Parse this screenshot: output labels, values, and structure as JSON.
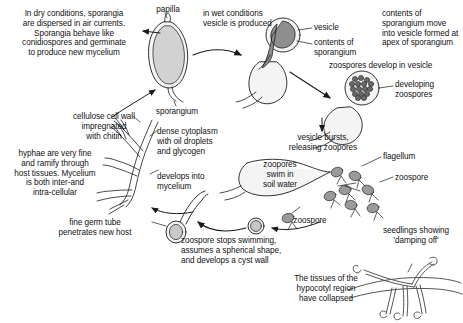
{
  "diagram": {
    "background_color": "#ffffff",
    "ink_color": "#1a1a1a",
    "fill_light": "#f2f2f2",
    "fill_mid": "#d9d9d9",
    "fill_dark": "#8c8c8c"
  },
  "labels": {
    "dry_conditions": "In dry conditions, sporangia\nare dispersed in air currents.\nSporangia behave like\nconidiospores and germinate\nto produce new mycelium",
    "papilla": "papilla",
    "wet_conditions": "in wet conditions\nvesicle is produced",
    "vesicle": "vesicle",
    "contents_of_sporangium": "contents of\nsporangium",
    "contents_move": "contents of\nsporangium move\ninto vesicle formed at\napex of sporangium",
    "sporangium": "sporangium",
    "zoospores_develop": "zoospores develop in vesicle",
    "developing_zoospores": "developing\nzoospores",
    "vesicle_bursts": "vesicle bursts,\nreleasing zoopores",
    "flagellum": "flagellum",
    "zoospore_right": "zoospore",
    "zoopores_swim": "zoopores\nswim in\nsoil water",
    "cellulose_wall": "cellulose cell wall\nimpregnated\nwith chitin",
    "dense_cytoplasm": "dense cytoplasm\nwith oil droplets\nand glycogen",
    "hyphae_fine": "hyphae are very fine\nand ramify through\nhost tissues. Mycelium\nis both inter-and\nintra-cellular",
    "develops_into_mycelium": "develops into\nmycelium",
    "fine_germ_tube": "fine germ tube\npenetrates new host",
    "zoospore_stops": "zoospore stops swimming,\nassumes a spherical shape,\nand develops a cyst wall",
    "zoospore_cyst": "zoospore",
    "seedlings_damping": "seedlings showing\n'damping off'",
    "tissues_collapsed": "The tissues of the\nhypocotyl region\nhave collapsed"
  }
}
